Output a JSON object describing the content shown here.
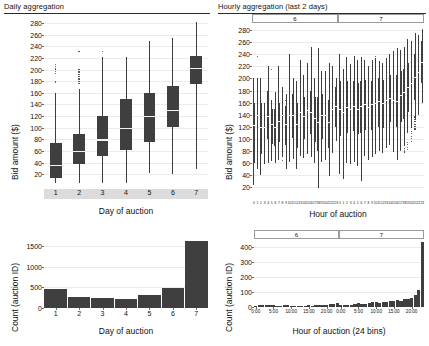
{
  "panels": {
    "top_left": {
      "title": "Daily aggregation"
    },
    "top_right": {
      "title": "Hourly aggregation (last 2 days)"
    }
  },
  "chart_data": [
    {
      "id": "daily-bid-boxplot",
      "type": "box",
      "title": "Daily aggregation",
      "xlabel": "Day of auction",
      "ylabel": "Bid amount ($)",
      "ylim": [
        0,
        292
      ],
      "yticks": [
        20,
        40,
        60,
        80,
        100,
        120,
        140,
        160,
        180,
        200,
        220,
        240,
        260,
        280
      ],
      "grid": true,
      "categories": [
        "1",
        "2",
        "3",
        "4",
        "5",
        "6",
        "7"
      ],
      "boxes": [
        {
          "category": "1",
          "lower_whisker": 5,
          "q1": 14,
          "median": 36,
          "q3": 74,
          "upper_whisker": 160,
          "outliers": [
            178,
            180,
            193,
            197,
            201,
            205,
            209
          ]
        },
        {
          "category": "2",
          "lower_whisker": 5,
          "q1": 37,
          "median": 60,
          "q3": 89,
          "upper_whisker": 166,
          "outliers": [
            176,
            180,
            184,
            188,
            192,
            196,
            200,
            231
          ]
        },
        {
          "category": "3",
          "lower_whisker": 6,
          "q1": 52,
          "median": 80,
          "q3": 120,
          "upper_whisker": 222,
          "outliers": [
            231
          ]
        },
        {
          "category": "4",
          "lower_whisker": 5,
          "q1": 61,
          "median": 100,
          "q3": 150,
          "upper_whisker": 221,
          "outliers": []
        },
        {
          "category": "5",
          "lower_whisker": 22,
          "q1": 75,
          "median": 120,
          "q3": 160,
          "upper_whisker": 249,
          "outliers": []
        },
        {
          "category": "6",
          "lower_whisker": 20,
          "q1": 101,
          "median": 131,
          "q3": 171,
          "upper_whisker": 254,
          "outliers": []
        },
        {
          "category": "7",
          "lower_whisker": 30,
          "q1": 176,
          "median": 203,
          "q3": 224,
          "upper_whisker": 282,
          "outliers": [
            38,
            42,
            46,
            50,
            55,
            60,
            66,
            72,
            78,
            84,
            90,
            96,
            101
          ]
        }
      ]
    },
    {
      "id": "hourly-bid-boxplot",
      "type": "box",
      "title": "Hourly aggregation (last 2 days)",
      "xlabel": "Hour of auction",
      "ylabel": "Bid amount ($)",
      "ylim": [
        0,
        292
      ],
      "yticks": [
        20,
        40,
        60,
        80,
        100,
        120,
        140,
        160,
        180,
        200,
        220,
        240,
        260,
        280
      ],
      "grid": true,
      "facets": [
        "6",
        "7"
      ],
      "xticklabels": [
        "0",
        "1",
        "2",
        "3",
        "4",
        "5",
        "6",
        "7",
        "8",
        "9",
        "10",
        "11",
        "12",
        "13",
        "14",
        "15",
        "16",
        "17",
        "18",
        "19",
        "20",
        "21",
        "22",
        "23"
      ],
      "facet_6": [
        {
          "hour": 0,
          "lower_whisker": 24,
          "q1": 60,
          "median": 122,
          "q3": 160,
          "upper_whisker": 200,
          "outliers": []
        },
        {
          "hour": 1,
          "lower_whisker": 50,
          "q1": 95,
          "median": 140,
          "q3": 175,
          "upper_whisker": 200,
          "outliers": [
            236
          ]
        },
        {
          "hour": 2,
          "lower_whisker": 40,
          "q1": 75,
          "median": 120,
          "q3": 160,
          "upper_whisker": 201,
          "outliers": []
        },
        {
          "hour": 3,
          "lower_whisker": 58,
          "q1": 85,
          "median": 120,
          "q3": 150,
          "upper_whisker": 160,
          "outliers": [
            76
          ]
        },
        {
          "hour": 4,
          "lower_whisker": 60,
          "q1": 100,
          "median": 138,
          "q3": 180,
          "upper_whisker": 220,
          "outliers": []
        },
        {
          "hour": 5,
          "lower_whisker": 63,
          "q1": 92,
          "median": 125,
          "q3": 150,
          "upper_whisker": 165,
          "outliers": [
            215
          ]
        },
        {
          "hour": 6,
          "lower_whisker": 59,
          "q1": 88,
          "median": 120,
          "q3": 150,
          "upper_whisker": 178,
          "outliers": []
        },
        {
          "hour": 7,
          "lower_whisker": 65,
          "q1": 95,
          "median": 130,
          "q3": 160,
          "upper_whisker": 220,
          "outliers": []
        },
        {
          "hour": 8,
          "lower_whisker": 70,
          "q1": 105,
          "median": 140,
          "q3": 165,
          "upper_whisker": 185,
          "outliers": [
            64
          ]
        },
        {
          "hour": 9,
          "lower_whisker": 50,
          "q1": 90,
          "median": 125,
          "q3": 155,
          "upper_whisker": 175,
          "outliers": [
            163
          ]
        },
        {
          "hour": 10,
          "lower_whisker": 62,
          "q1": 100,
          "median": 140,
          "q3": 180,
          "upper_whisker": 240,
          "outliers": []
        },
        {
          "hour": 11,
          "lower_whisker": 66,
          "q1": 102,
          "median": 140,
          "q3": 175,
          "upper_whisker": 200,
          "outliers": []
        },
        {
          "hour": 12,
          "lower_whisker": 49,
          "q1": 85,
          "median": 125,
          "q3": 160,
          "upper_whisker": 195,
          "outliers": []
        },
        {
          "hour": 13,
          "lower_whisker": 72,
          "q1": 105,
          "median": 145,
          "q3": 180,
          "upper_whisker": 230,
          "outliers": []
        },
        {
          "hour": 14,
          "lower_whisker": 68,
          "q1": 100,
          "median": 138,
          "q3": 170,
          "upper_whisker": 205,
          "outliers": []
        },
        {
          "hour": 15,
          "lower_whisker": 75,
          "q1": 110,
          "median": 148,
          "q3": 185,
          "upper_whisker": 226,
          "outliers": []
        },
        {
          "hour": 16,
          "lower_whisker": 70,
          "q1": 108,
          "median": 145,
          "q3": 180,
          "upper_whisker": 252,
          "outliers": []
        },
        {
          "hour": 17,
          "lower_whisker": 60,
          "q1": 95,
          "median": 135,
          "q3": 170,
          "upper_whisker": 200,
          "outliers": []
        },
        {
          "hour": 18,
          "lower_whisker": 18,
          "q1": 80,
          "median": 128,
          "q3": 170,
          "upper_whisker": 250,
          "outliers": []
        },
        {
          "hour": 19,
          "lower_whisker": 61,
          "q1": 100,
          "median": 140,
          "q3": 175,
          "upper_whisker": 212,
          "outliers": []
        },
        {
          "hour": 20,
          "lower_whisker": 64,
          "q1": 100,
          "median": 140,
          "q3": 178,
          "upper_whisker": 213,
          "outliers": []
        },
        {
          "hour": 21,
          "lower_whisker": 38,
          "q1": 85,
          "median": 128,
          "q3": 165,
          "upper_whisker": 226,
          "outliers": []
        },
        {
          "hour": 22,
          "lower_whisker": 77,
          "q1": 110,
          "median": 150,
          "q3": 185,
          "upper_whisker": 220,
          "outliers": []
        },
        {
          "hour": 23,
          "lower_whisker": 96,
          "q1": 120,
          "median": 155,
          "q3": 185,
          "upper_whisker": 200,
          "outliers": []
        }
      ],
      "facet_7": [
        {
          "hour": 0,
          "lower_whisker": 42,
          "q1": 105,
          "median": 150,
          "q3": 195,
          "upper_whisker": 240,
          "outliers": []
        },
        {
          "hour": 1,
          "lower_whisker": 33,
          "q1": 100,
          "median": 145,
          "q3": 185,
          "upper_whisker": 215,
          "outliers": []
        },
        {
          "hour": 2,
          "lower_whisker": 60,
          "q1": 110,
          "median": 152,
          "q3": 195,
          "upper_whisker": 236,
          "outliers": []
        },
        {
          "hour": 3,
          "lower_whisker": 58,
          "q1": 108,
          "median": 150,
          "q3": 190,
          "upper_whisker": 224,
          "outliers": []
        },
        {
          "hour": 4,
          "lower_whisker": 62,
          "q1": 112,
          "median": 155,
          "q3": 196,
          "upper_whisker": 238,
          "outliers": []
        },
        {
          "hour": 5,
          "lower_whisker": 55,
          "q1": 108,
          "median": 150,
          "q3": 192,
          "upper_whisker": 230,
          "outliers": []
        },
        {
          "hour": 6,
          "lower_whisker": 30,
          "q1": 110,
          "median": 155,
          "q3": 196,
          "upper_whisker": 235,
          "outliers": []
        },
        {
          "hour": 7,
          "lower_whisker": 72,
          "q1": 115,
          "median": 158,
          "q3": 198,
          "upper_whisker": 231,
          "outliers": [
            74
          ]
        },
        {
          "hour": 8,
          "lower_whisker": 64,
          "q1": 110,
          "median": 152,
          "q3": 192,
          "upper_whisker": 221,
          "outliers": []
        },
        {
          "hour": 9,
          "lower_whisker": 70,
          "q1": 115,
          "median": 158,
          "q3": 196,
          "upper_whisker": 230,
          "outliers": []
        },
        {
          "hour": 10,
          "lower_whisker": 75,
          "q1": 118,
          "median": 160,
          "q3": 200,
          "upper_whisker": 234,
          "outliers": [
            236
          ]
        },
        {
          "hour": 11,
          "lower_whisker": 80,
          "q1": 120,
          "median": 162,
          "q3": 200,
          "upper_whisker": 229,
          "outliers": []
        },
        {
          "hour": 12,
          "lower_whisker": 76,
          "q1": 118,
          "median": 160,
          "q3": 198,
          "upper_whisker": 225,
          "outliers": []
        },
        {
          "hour": 13,
          "lower_whisker": 85,
          "q1": 125,
          "median": 165,
          "q3": 202,
          "upper_whisker": 234,
          "outliers": [
            120
          ]
        },
        {
          "hour": 14,
          "lower_whisker": 90,
          "q1": 128,
          "median": 168,
          "q3": 205,
          "upper_whisker": 240,
          "outliers": [
            134
          ]
        },
        {
          "hour": 15,
          "lower_whisker": 78,
          "q1": 122,
          "median": 165,
          "q3": 205,
          "upper_whisker": 245,
          "outliers": []
        },
        {
          "hour": 16,
          "lower_whisker": 65,
          "q1": 120,
          "median": 163,
          "q3": 205,
          "upper_whisker": 250,
          "outliers": [
            78,
            82
          ]
        },
        {
          "hour": 17,
          "lower_whisker": 82,
          "q1": 128,
          "median": 172,
          "q3": 212,
          "upper_whisker": 248,
          "outliers": [
            80
          ]
        },
        {
          "hour": 18,
          "lower_whisker": 88,
          "q1": 132,
          "median": 178,
          "q3": 215,
          "upper_whisker": 252,
          "outliers": [
            78,
            81,
            84
          ]
        },
        {
          "hour": 19,
          "lower_whisker": 110,
          "q1": 145,
          "median": 186,
          "q3": 225,
          "upper_whisker": 266,
          "outliers": [
            82,
            86,
            90,
            94
          ]
        },
        {
          "hour": 20,
          "lower_whisker": 118,
          "q1": 152,
          "median": 192,
          "q3": 232,
          "upper_whisker": 262,
          "outliers": [
            96,
            100,
            104,
            108,
            112
          ]
        },
        {
          "hour": 21,
          "lower_whisker": 132,
          "q1": 165,
          "median": 202,
          "q3": 240,
          "upper_whisker": 275,
          "outliers": [
            116,
            120,
            124,
            128,
            132,
            136
          ]
        },
        {
          "hour": 22,
          "lower_whisker": 140,
          "q1": 172,
          "median": 210,
          "q3": 248,
          "upper_whisker": 272,
          "outliers": [
            140,
            144,
            148,
            152,
            156,
            160,
            164,
            254
          ]
        },
        {
          "hour": 23,
          "lower_whisker": 160,
          "q1": 192,
          "median": 228,
          "q3": 262,
          "upper_whisker": 281,
          "outliers": [
            166,
            170,
            281
          ]
        }
      ]
    },
    {
      "id": "daily-auction-count",
      "type": "bar",
      "xlabel": "Day of auction",
      "ylabel": "Count (auction ID)",
      "ylim": [
        0,
        1750
      ],
      "yticks": [
        0,
        500,
        1000,
        1500
      ],
      "categories": [
        "1",
        "2",
        "3",
        "4",
        "5",
        "6",
        "7"
      ],
      "values": [
        468,
        268,
        248,
        212,
        322,
        480,
        1620
      ]
    },
    {
      "id": "hourly-auction-count",
      "type": "bar",
      "xlabel": "Hour of auction (24 bins)",
      "ylabel": "Count (auction ID)",
      "ylim": [
        0,
        450
      ],
      "yticks": [
        0,
        100,
        200,
        300,
        400
      ],
      "facets": [
        "6",
        "7"
      ],
      "xticklabels": [
        "0:00",
        "5:00",
        "10:00",
        "15:00",
        "20:00"
      ],
      "facet_6_values": [
        6,
        10,
        16,
        14,
        12,
        10,
        8,
        9,
        10,
        11,
        9,
        8,
        7,
        9,
        8,
        10,
        9,
        11,
        10,
        12,
        14,
        18,
        22,
        26
      ],
      "facet_7_values": [
        12,
        10,
        14,
        16,
        20,
        24,
        18,
        22,
        26,
        30,
        32,
        28,
        36,
        34,
        40,
        38,
        44,
        42,
        56,
        50,
        62,
        78,
        110,
        428
      ]
    }
  ]
}
